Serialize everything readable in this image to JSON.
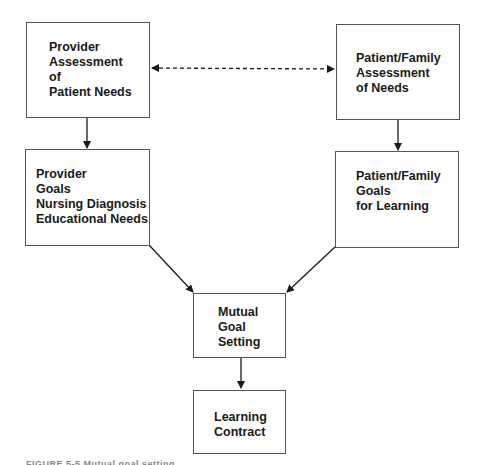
{
  "diagram": {
    "nodes": {
      "provider_assessment": {
        "text": "Provider\nAssessment\nof\nPatient Needs"
      },
      "family_assessment": {
        "text": "Patient/Family\nAssessment\nof Needs"
      },
      "provider_goals": {
        "text": "Provider\nGoals\nNursing Diagnosis\nEducational Needs"
      },
      "family_goals": {
        "text": "Patient/Family\nGoals\nfor Learning"
      },
      "mutual_goal": {
        "text": "Mutual\nGoal\nSetting"
      },
      "learning_contract": {
        "text": "Learning\nContract"
      }
    },
    "edges": [
      {
        "from": "provider_assessment",
        "to": "family_assessment",
        "style": "dashed",
        "bidirectional": true
      },
      {
        "from": "provider_assessment",
        "to": "provider_goals",
        "style": "solid"
      },
      {
        "from": "family_assessment",
        "to": "family_goals",
        "style": "solid"
      },
      {
        "from": "provider_goals",
        "to": "mutual_goal",
        "style": "solid"
      },
      {
        "from": "family_goals",
        "to": "mutual_goal",
        "style": "solid"
      },
      {
        "from": "mutual_goal",
        "to": "learning_contract",
        "style": "solid"
      }
    ],
    "caption": "FIGURE 5-5 Mutual goal setting"
  }
}
